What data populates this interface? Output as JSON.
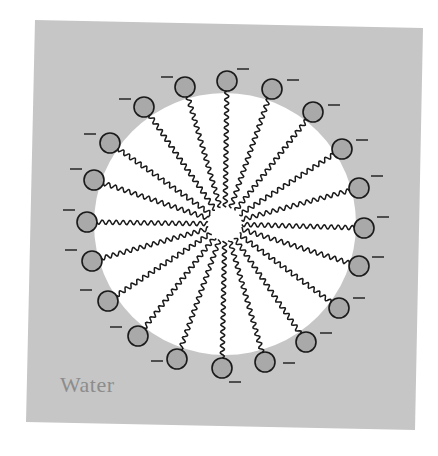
{
  "figure": {
    "colors": {
      "page_bg": "#ffffff",
      "water_bg": "#c6c6c6",
      "core_fill": "#ffffff",
      "head_fill": "#a9a9a9",
      "stroke": "#1a1a1a",
      "label": "#8c8c8c"
    },
    "background_box": {
      "points": [
        [
          35,
          20
        ],
        [
          423,
          28
        ],
        [
          415,
          430
        ],
        [
          26,
          422
        ]
      ]
    },
    "core": {
      "cx": 225,
      "cy": 224,
      "r": 131
    },
    "center": {
      "cx": 225,
      "cy": 224,
      "tail_inner_r": 17
    },
    "head_radius": 10,
    "charge_symbol": "−",
    "labels": {
      "solvent": "Water"
    },
    "molecules": [
      {
        "head": [
          185,
          87
        ],
        "minus": [
          167,
          77
        ]
      },
      {
        "head": [
          227,
          81
        ],
        "minus": [
          243,
          69
        ]
      },
      {
        "head": [
          272,
          89
        ],
        "minus": [
          293,
          80
        ]
      },
      {
        "head": [
          313,
          112
        ],
        "minus": [
          334,
          105
        ]
      },
      {
        "head": [
          342,
          149
        ],
        "minus": [
          362,
          140
        ]
      },
      {
        "head": [
          359,
          188
        ],
        "minus": [
          377,
          176
        ]
      },
      {
        "head": [
          364,
          228
        ],
        "minus": [
          383,
          217
        ]
      },
      {
        "head": [
          359,
          266
        ],
        "minus": [
          378,
          257
        ]
      },
      {
        "head": [
          339,
          308
        ],
        "minus": [
          359,
          298
        ]
      },
      {
        "head": [
          306,
          342
        ],
        "minus": [
          326,
          333
        ]
      },
      {
        "head": [
          265,
          362
        ],
        "minus": [
          289,
          363
        ]
      },
      {
        "head": [
          222,
          368
        ],
        "minus": [
          235,
          382
        ]
      },
      {
        "head": [
          177,
          359
        ],
        "minus": [
          157,
          361
        ]
      },
      {
        "head": [
          138,
          336
        ],
        "minus": [
          116,
          327
        ]
      },
      {
        "head": [
          108,
          301
        ],
        "minus": [
          86,
          290
        ]
      },
      {
        "head": [
          92,
          261
        ],
        "minus": [
          71,
          250
        ]
      },
      {
        "head": [
          87,
          222
        ],
        "minus": [
          69,
          210
        ]
      },
      {
        "head": [
          94,
          180
        ],
        "minus": [
          76,
          169
        ]
      },
      {
        "head": [
          110,
          143
        ],
        "minus": [
          90,
          134
        ]
      },
      {
        "head": [
          144,
          107
        ],
        "minus": [
          125,
          99
        ]
      }
    ]
  }
}
